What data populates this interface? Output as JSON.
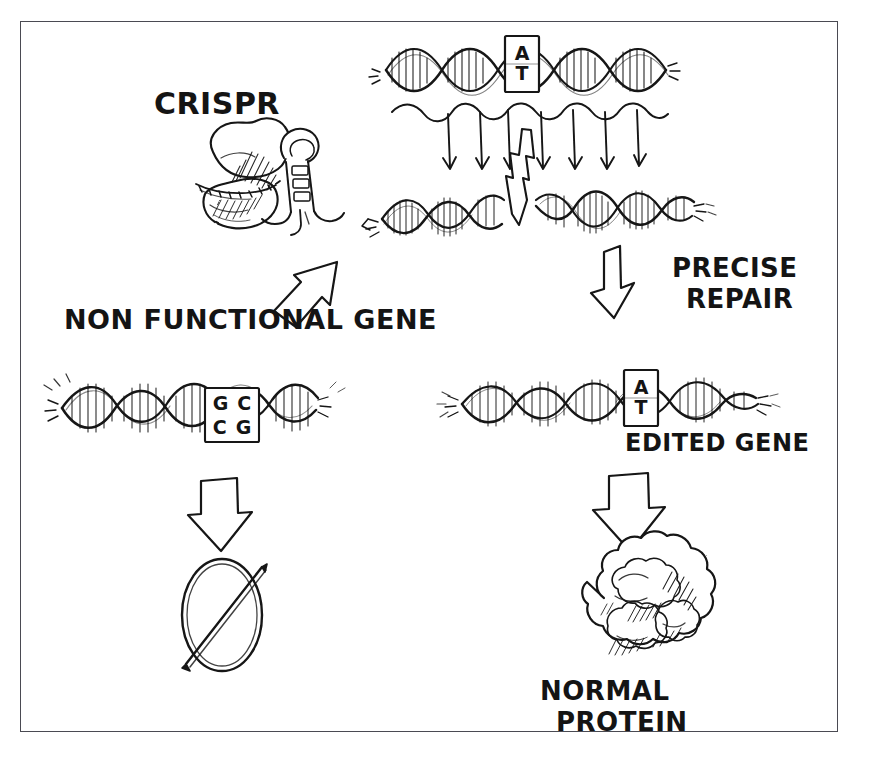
{
  "diagram": {
    "ink_color": "#141414",
    "frame_color": "#4a4a52",
    "background_color": "#ffffff"
  },
  "labels": {
    "crispr": "CRISPR",
    "non_functional_gene": "NON FUNCTIONAL GENE",
    "precise_repair_line1": "PRECISE",
    "precise_repair_line2": "REPAIR",
    "edited_gene": "EDITED GENE",
    "normal_protein_line1": "NORMAL",
    "normal_protein_line2": "PROTEIN"
  },
  "base_boxes": {
    "target_dna_top": {
      "top": "A",
      "bottom": "T"
    },
    "mutant_gene": {
      "top_left": "G",
      "top_right": "C",
      "bottom_left": "C",
      "bottom_right": "G"
    },
    "edited_gene": {
      "top": "A",
      "bottom": "T"
    }
  },
  "elements": {
    "cas9_protein": "cas9-nuclease-blob",
    "guide_rna": "guide-rna-hairpin",
    "target_dna": "double-helix-with-at-box",
    "guide_arrows_count": 7,
    "cut_symbol": "lightning-bolt-double-strand-break",
    "cut_dna": "cleaved-double-helix",
    "mutant_dna": "double-helix-with-gc-cg-box",
    "edited_dna": "double-helix-with-at-box",
    "null_symbol": "slashed-ellipse-no-protein",
    "normal_protein": "folded-protein-blob",
    "arrow_crispr_to_dna": "arrow-up-right",
    "arrow_precise_repair": "arrow-down-right",
    "arrow_mutant_to_null": "arrow-down",
    "arrow_edited_to_protein": "arrow-down"
  }
}
